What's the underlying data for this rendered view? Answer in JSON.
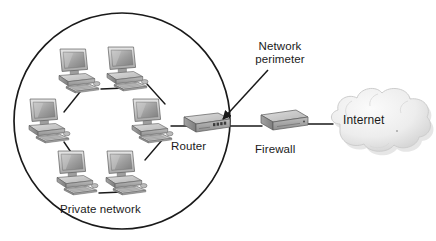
{
  "diagram": {
    "type": "network-topology",
    "canvas": {
      "width": 436,
      "height": 241,
      "background": "#ffffff"
    },
    "labels": {
      "router": "Router",
      "firewall": "Firewall",
      "internet": "Internet",
      "private_network": "Private network",
      "network_perimeter_line1": "Network",
      "network_perimeter_line2": "perimeter"
    },
    "colors": {
      "line": "#1a1a1a",
      "text": "#1a1a1a",
      "device_fill": "#b8b8b8",
      "device_top": "#d2d2d2",
      "device_side": "#8f8f8f",
      "screen": "#9a9a9a",
      "cloud": "#e8e8e8",
      "cloud_shadow": "#c9c9c9",
      "background": "#ffffff"
    },
    "perimeter_circle": {
      "cx": 122,
      "cy": 121,
      "r": 108,
      "stroke": "#1a1a1a",
      "stroke_width": 1.6
    },
    "nodes": [
      {
        "id": "pc1",
        "kind": "computer",
        "x": 75,
        "y": 60,
        "label": ""
      },
      {
        "id": "pc2",
        "kind": "computer",
        "x": 123,
        "y": 58,
        "label": ""
      },
      {
        "id": "pc3",
        "kind": "computer",
        "x": 45,
        "y": 112,
        "label": ""
      },
      {
        "id": "pc4",
        "kind": "computer",
        "x": 148,
        "y": 112,
        "label": ""
      },
      {
        "id": "pc5",
        "kind": "computer",
        "x": 73,
        "y": 165,
        "label": ""
      },
      {
        "id": "pc6",
        "kind": "computer",
        "x": 122,
        "y": 165,
        "label": ""
      },
      {
        "id": "router",
        "kind": "router",
        "x": 200,
        "y": 124,
        "label": "Router"
      },
      {
        "id": "firewall",
        "kind": "firewall",
        "x": 281,
        "y": 121,
        "label": "Firewall"
      },
      {
        "id": "internet",
        "kind": "cloud",
        "x": 375,
        "y": 122,
        "label": "Internet"
      }
    ],
    "links": [
      {
        "from": "pc1",
        "to": "pc2"
      },
      {
        "from": "pc2",
        "to": "pc4"
      },
      {
        "from": "pc4",
        "to": "pc6"
      },
      {
        "from": "pc6",
        "to": "pc5"
      },
      {
        "from": "pc5",
        "to": "pc3"
      },
      {
        "from": "pc3",
        "to": "pc1"
      },
      {
        "from": "pc4",
        "to": "router"
      },
      {
        "from": "router",
        "to": "firewall"
      },
      {
        "from": "firewall",
        "to": "internet"
      }
    ],
    "annotation": {
      "name": "network-perimeter-callout",
      "arrow_from": {
        "x": 268,
        "y": 72
      },
      "arrow_to": {
        "x": 221,
        "y": 121
      }
    }
  }
}
